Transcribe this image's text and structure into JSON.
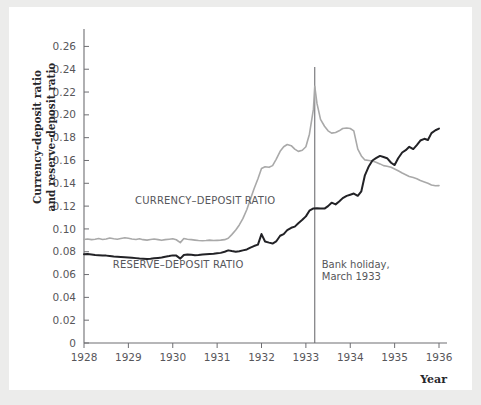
{
  "figure": {
    "background_color": "#ececeb",
    "panel_color": "#ffffff"
  },
  "chart_data": {
    "type": "line",
    "title": "",
    "subtitle": "",
    "xlabel": "Year",
    "ylabel": "Currency–deposit ratio and reserve–deposit ratio",
    "ylabel_line1": "Currency–deposit ratio",
    "ylabel_line2": "and reserve–deposit ratio",
    "xlim": [
      1928,
      1936
    ],
    "ylim": [
      0,
      0.27
    ],
    "grid": false,
    "legend_position": "inline-annotations",
    "xticks": [
      1928,
      1929,
      1930,
      1931,
      1932,
      1933,
      1934,
      1935,
      1936
    ],
    "xtick_labels": [
      "1928",
      "1929",
      "1930",
      "1931",
      "1932",
      "1933",
      "1934",
      "1935",
      "1936"
    ],
    "yticks": [
      0,
      0.02,
      0.04,
      0.06,
      0.08,
      0.1,
      0.12,
      0.14,
      0.16,
      0.18,
      0.2,
      0.22,
      0.24,
      0.26
    ],
    "ytick_labels": [
      "0",
      "0.02",
      "0.04",
      "0.06",
      "0.08",
      "0.10",
      "0.12",
      "0.14",
      "0.16",
      "0.18",
      "0.20",
      "0.22",
      "0.24",
      "0.26"
    ],
    "annotations": [
      {
        "name": "bank-holiday",
        "line1": "Bank holiday,",
        "line2": "March 1933",
        "x": 1933.2,
        "type": "vline",
        "color": "#6e6e72"
      }
    ],
    "series": [
      {
        "name": "CURRENCY–DEPOSIT RATIO",
        "label": "CURRENCY–DEPOSIT RATIO",
        "color": "#a9a9a9",
        "linewidth": 1.6,
        "label_x": 1929.15,
        "label_y": 0.1215,
        "x": [
          1928.0,
          1928.08,
          1928.17,
          1928.25,
          1928.33,
          1928.42,
          1928.5,
          1928.58,
          1928.67,
          1928.75,
          1928.83,
          1928.92,
          1929.0,
          1929.08,
          1929.17,
          1929.25,
          1929.33,
          1929.42,
          1929.5,
          1929.58,
          1929.67,
          1929.75,
          1929.83,
          1929.92,
          1930.0,
          1930.08,
          1930.17,
          1930.25,
          1930.33,
          1930.42,
          1930.5,
          1930.58,
          1930.67,
          1930.75,
          1930.83,
          1930.92,
          1931.0,
          1931.08,
          1931.17,
          1931.25,
          1931.33,
          1931.42,
          1931.5,
          1931.58,
          1931.67,
          1931.75,
          1931.83,
          1931.92,
          1932.0,
          1932.08,
          1932.17,
          1932.25,
          1932.33,
          1932.42,
          1932.5,
          1932.58,
          1932.67,
          1932.75,
          1932.83,
          1932.92,
          1933.0,
          1933.08,
          1933.17,
          1933.2,
          1933.25,
          1933.33,
          1933.42,
          1933.5,
          1933.58,
          1933.67,
          1933.75,
          1933.83,
          1933.92,
          1934.0,
          1934.08,
          1934.17,
          1934.25,
          1934.33,
          1934.42,
          1934.5,
          1934.58,
          1934.67,
          1934.75,
          1934.83,
          1934.92,
          1935.0,
          1935.08,
          1935.17,
          1935.25,
          1935.33,
          1935.42,
          1935.5,
          1935.58,
          1935.67,
          1935.75,
          1935.83,
          1935.92,
          1936.0
        ],
        "y": [
          0.0908,
          0.0912,
          0.0906,
          0.091,
          0.0916,
          0.0908,
          0.0912,
          0.092,
          0.0914,
          0.091,
          0.0916,
          0.0922,
          0.0918,
          0.0912,
          0.0908,
          0.0914,
          0.0906,
          0.0902,
          0.0908,
          0.0912,
          0.0906,
          0.09,
          0.0906,
          0.091,
          0.0914,
          0.0905,
          0.088,
          0.0916,
          0.091,
          0.0906,
          0.0902,
          0.0898,
          0.0896,
          0.0898,
          0.0902,
          0.0898,
          0.09,
          0.0902,
          0.0906,
          0.0918,
          0.095,
          0.099,
          0.1035,
          0.109,
          0.117,
          0.126,
          0.135,
          0.144,
          0.153,
          0.1545,
          0.154,
          0.1555,
          0.161,
          0.168,
          0.172,
          0.174,
          0.173,
          0.17,
          0.168,
          0.169,
          0.172,
          0.183,
          0.205,
          0.225,
          0.21,
          0.196,
          0.19,
          0.186,
          0.184,
          0.1845,
          0.186,
          0.188,
          0.1885,
          0.188,
          0.186,
          0.17,
          0.164,
          0.1605,
          0.16,
          0.1595,
          0.1585,
          0.157,
          0.1555,
          0.155,
          0.154,
          0.1525,
          0.151,
          0.149,
          0.1475,
          0.146,
          0.145,
          0.144,
          0.1425,
          0.1412,
          0.14,
          0.1385,
          0.1378,
          0.138
        ]
      },
      {
        "name": "RESERVE–DEPOSIT RATIO",
        "label": "RESERVE–DEPOSIT RATIO",
        "color": "#222226",
        "linewidth": 2.0,
        "label_x": 1928.65,
        "label_y": 0.0655,
        "x": [
          1928.0,
          1928.08,
          1928.17,
          1928.25,
          1928.33,
          1928.42,
          1928.5,
          1928.58,
          1928.67,
          1928.75,
          1928.83,
          1928.92,
          1929.0,
          1929.08,
          1929.17,
          1929.25,
          1929.33,
          1929.42,
          1929.5,
          1929.58,
          1929.67,
          1929.75,
          1929.83,
          1929.92,
          1930.0,
          1930.08,
          1930.17,
          1930.25,
          1930.33,
          1930.42,
          1930.5,
          1930.58,
          1930.67,
          1930.75,
          1930.83,
          1930.92,
          1931.0,
          1931.08,
          1931.17,
          1931.25,
          1931.33,
          1931.42,
          1931.5,
          1931.58,
          1931.67,
          1931.75,
          1931.83,
          1931.92,
          1932.0,
          1932.08,
          1932.17,
          1932.25,
          1932.33,
          1932.42,
          1932.5,
          1932.58,
          1932.67,
          1932.75,
          1932.83,
          1932.92,
          1933.0,
          1933.08,
          1933.17,
          1933.25,
          1933.33,
          1933.42,
          1933.5,
          1933.58,
          1933.67,
          1933.75,
          1933.83,
          1933.92,
          1934.0,
          1934.08,
          1934.17,
          1934.25,
          1934.33,
          1934.42,
          1934.5,
          1934.58,
          1934.67,
          1934.75,
          1934.83,
          1934.92,
          1935.0,
          1935.08,
          1935.17,
          1935.25,
          1935.33,
          1935.42,
          1935.5,
          1935.58,
          1935.67,
          1935.75,
          1935.83,
          1935.92,
          1936.0
        ],
        "y": [
          0.0778,
          0.078,
          0.0776,
          0.0772,
          0.077,
          0.0768,
          0.0766,
          0.0762,
          0.0758,
          0.0756,
          0.0754,
          0.0752,
          0.075,
          0.0748,
          0.0744,
          0.074,
          0.0738,
          0.0736,
          0.0738,
          0.0742,
          0.0746,
          0.075,
          0.0756,
          0.0762,
          0.0768,
          0.0766,
          0.074,
          0.0772,
          0.0776,
          0.0774,
          0.077,
          0.0772,
          0.0776,
          0.0778,
          0.078,
          0.0782,
          0.0786,
          0.079,
          0.08,
          0.0812,
          0.0806,
          0.08,
          0.0804,
          0.0812,
          0.082,
          0.0836,
          0.085,
          0.0862,
          0.0955,
          0.089,
          0.088,
          0.0872,
          0.089,
          0.094,
          0.0955,
          0.099,
          0.101,
          0.102,
          0.105,
          0.108,
          0.111,
          0.116,
          0.118,
          0.1182,
          0.118,
          0.1178,
          0.12,
          0.123,
          0.1215,
          0.124,
          0.127,
          0.129,
          0.13,
          0.131,
          0.129,
          0.133,
          0.147,
          0.155,
          0.16,
          0.162,
          0.164,
          0.163,
          0.162,
          0.158,
          0.156,
          0.162,
          0.167,
          0.169,
          0.172,
          0.17,
          0.1735,
          0.1775,
          0.179,
          0.178,
          0.184,
          0.1865,
          0.188
        ]
      }
    ]
  }
}
